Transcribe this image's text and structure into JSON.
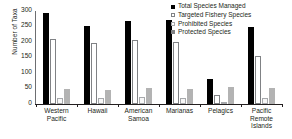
{
  "chart_data": {
    "type": "bar",
    "title": "",
    "xlabel": "",
    "ylabel": "Number of Taxa",
    "ylim": [
      0,
      300
    ],
    "yticks": [
      0,
      50,
      100,
      150,
      200,
      250,
      300
    ],
    "grid": false,
    "legend_position": "top-right",
    "categories": [
      "Western Pacific",
      "Hawaii",
      "American Samoa",
      "Marianas",
      "Pelagics",
      "Pacific Remote Islands"
    ],
    "category_lines": [
      [
        "Western",
        "Pacific"
      ],
      [
        "Hawaii"
      ],
      [
        "American",
        "Samoa"
      ],
      [
        "Marianas"
      ],
      [
        "Pelagics"
      ],
      [
        "Pacific",
        "Remote",
        "Islands"
      ]
    ],
    "series": [
      {
        "name": "Total Species Managed",
        "color": "#000000",
        "values": [
          293,
          253,
          268,
          272,
          80,
          250
        ]
      },
      {
        "name": "Targeted Fishery Species",
        "color": "#ffffff",
        "values": [
          210,
          196,
          205,
          200,
          30,
          155
        ]
      },
      {
        "name": "Prohibited Species",
        "color": "#ffffff",
        "values": [
          20,
          18,
          22,
          20,
          8,
          18
        ]
      },
      {
        "name": "Protected Species",
        "color": "#b3b3b3",
        "values": [
          48,
          46,
          52,
          50,
          55,
          52
        ]
      }
    ]
  },
  "legend": {
    "items": [
      {
        "label": "Total Species Managed"
      },
      {
        "label": "Targeted Fishery Species"
      },
      {
        "label": "Prohibited Species"
      },
      {
        "label": "Protected Species"
      }
    ]
  },
  "axis": {
    "y_title": "Number of Taxa"
  }
}
